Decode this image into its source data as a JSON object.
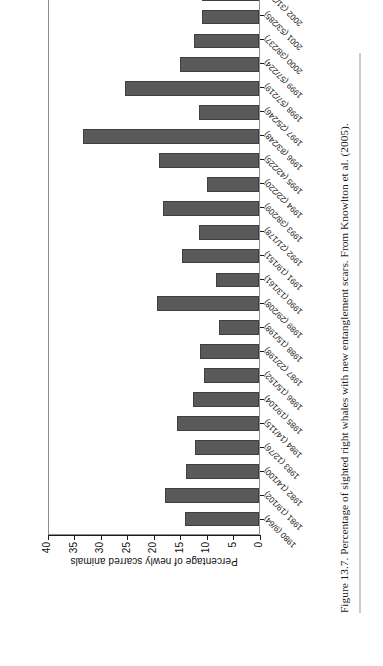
{
  "figure": {
    "caption": "Figure 13.7.  Percentage of sighted right whales with new entanglement scars. From Knowlton et al. (2005)."
  },
  "chart_data": {
    "type": "bar",
    "title": "",
    "xlabel": "",
    "ylabel": "Percentage of newly scarred animals",
    "ylim": [
      0,
      40
    ],
    "yticks": [
      "0",
      "5",
      "10",
      "15",
      "20",
      "25",
      "30",
      "35",
      "40"
    ],
    "grid": false,
    "legend": "none",
    "orientation": "vertical-bars-rotated-page",
    "bar_color": "#5a5a5a",
    "categories": [
      "1980 (9/64)",
      "1981 (19/102)",
      "1982 (14/100)",
      "1983 (12/76)",
      "1984 (14/115)",
      "1985 (19/104)",
      "1986 (15/152)",
      "1987 (22/198)",
      "1988 (15/198)",
      "1989 (29/208)",
      "1990 (13/161)",
      "1991 (19/151)",
      "1992 (21/178)",
      "1993 (38/209)",
      "1994 (22/220)",
      "1995 (42/225)",
      "1996 (83/248)",
      "1997 (25/246)",
      "1998 (57/219)",
      "1999 (57/224)",
      "2000 (38/237)",
      "2001 (53/285)",
      "2002 (31/286)"
    ],
    "values": [
      14.1,
      18.0,
      14.0,
      12.2,
      15.7,
      12.5,
      10.5,
      11.2,
      7.6,
      19.5,
      8.1,
      14.6,
      11.5,
      18.2,
      10.0,
      19.0,
      33.5,
      11.4,
      25.5,
      15.0,
      12.3,
      10.8,
      10.8
    ]
  }
}
